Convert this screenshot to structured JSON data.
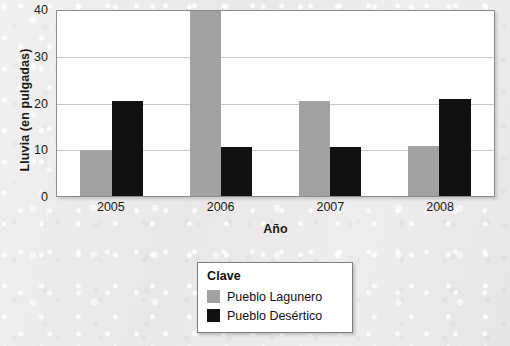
{
  "chart_data": {
    "type": "bar",
    "title": "",
    "xlabel": "Año",
    "ylabel": "Lluvia (en pulgadas)",
    "categories": [
      "2005",
      "2006",
      "2007",
      "2008"
    ],
    "ylim": [
      0,
      40
    ],
    "yticks": [
      "0",
      "10",
      "20",
      "30",
      "40"
    ],
    "ytick_values": [
      0,
      10,
      20,
      30,
      40
    ],
    "grid": true,
    "legend_position": "below-center",
    "legend_title": "Clave",
    "series": [
      {
        "name": "Pueblo Lagunero",
        "color": "#a2a2a2",
        "values": [
          10,
          41,
          20.5,
          10.8
        ],
        "clipped": [
          false,
          true,
          false,
          false
        ]
      },
      {
        "name": "Pueblo Desértico",
        "color": "#111111",
        "values": [
          20.5,
          10.5,
          10.5,
          21
        ],
        "clipped": [
          false,
          false,
          false,
          false
        ]
      }
    ]
  },
  "axes": {
    "y_title": "Lluvia (en pulgadas)",
    "x_title": "Año",
    "y_tick_labels": [
      "40",
      "30",
      "20",
      "10",
      "0"
    ],
    "x_tick_labels": [
      "2005",
      "2006",
      "2007",
      "2008"
    ]
  },
  "legend": {
    "title": "Clave",
    "entries": [
      {
        "label": "Pueblo Lagunero",
        "color": "#a2a2a2",
        "swatch": "gray-square-swatch"
      },
      {
        "label": "Pueblo Desértico",
        "color": "#111111",
        "swatch": "black-square-swatch"
      }
    ]
  },
  "colors": {
    "lagunero": "#a2a2a2",
    "desertico": "#111111",
    "plot_background": "#ffffff",
    "page_background": "#eceaea",
    "gridline": "#c9c9c9",
    "axis_border": "#8d8d8d",
    "text": "#1a1a1a"
  }
}
